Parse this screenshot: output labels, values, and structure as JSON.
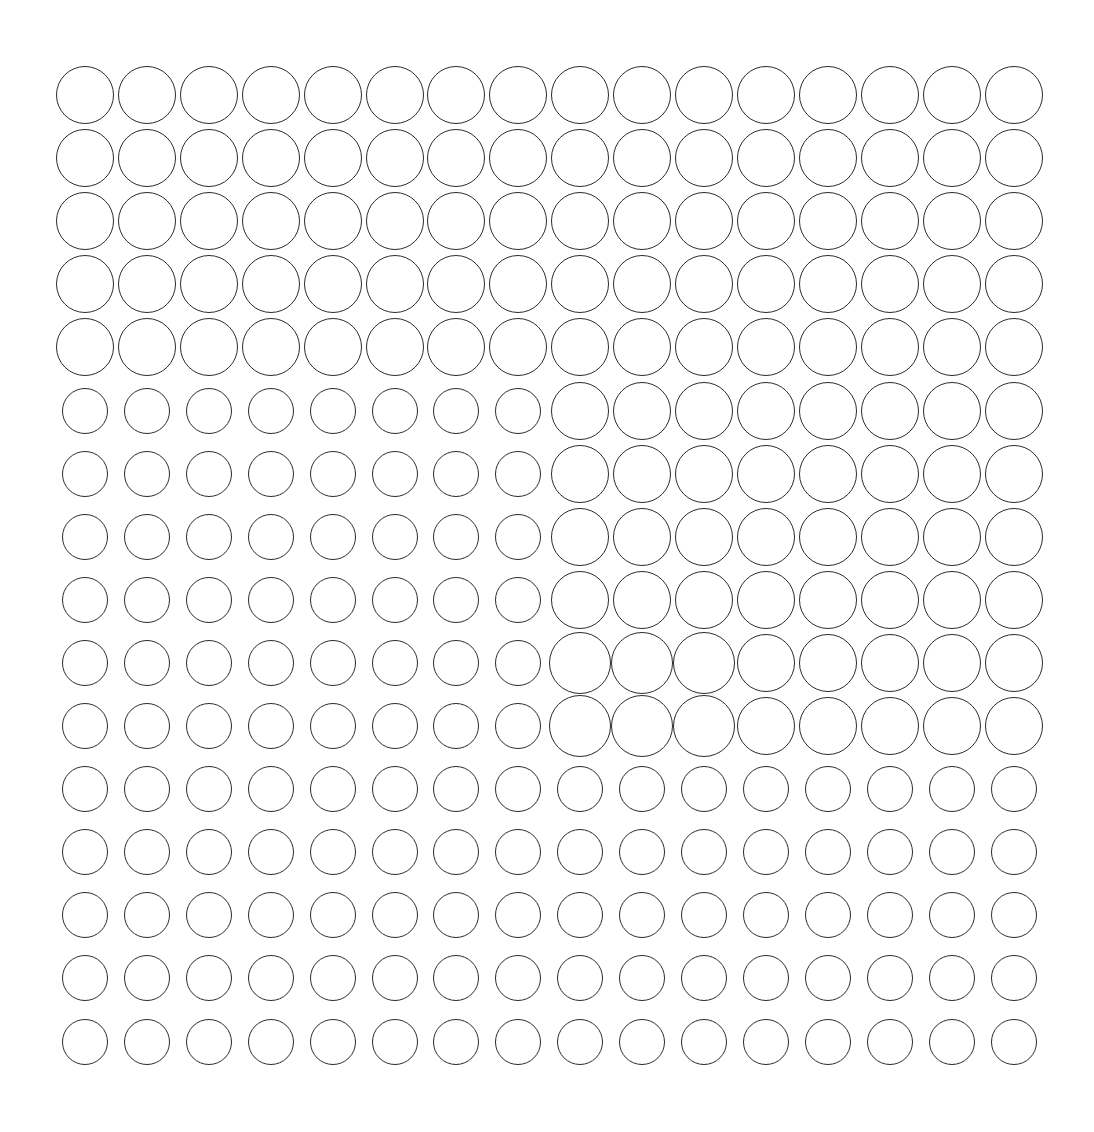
{
  "figure": {
    "rows": 16,
    "cols": 16,
    "origin_center": [
      85,
      95
    ],
    "pitch": [
      61.9,
      63.1
    ],
    "stroke_color": "#2b2b2b",
    "background": "#ffffff",
    "sizes": {
      "L": 58,
      "XL": 62,
      "S": 46
    },
    "grid": [
      "LLLLLLLLLLLLLLLL",
      "LLLLLLLLLLLLLLLL",
      "LLLLLLLLLLLLLLLL",
      "LLLLLLLLLLLLLLLL",
      "LLLLLLLLLLLLLLLL",
      "SSSSSSSSLLLLLLLL",
      "SSSSSSSSLLLLLLLL",
      "SSSSSSSSLLLLLLLL",
      "SSSSSSSSLLLLLLLL",
      "SSSSSSSSXXXLLLLL",
      "SSSSSSSSXXXLLLLL",
      "SSSSSSSSSSSSSSSS",
      "SSSSSSSSSSSSSSSS",
      "SSSSSSSSSSSSSSSS",
      "SSSSSSSSSSSSSSSS",
      "SSSSSSSSSSSSSSSS"
    ]
  }
}
